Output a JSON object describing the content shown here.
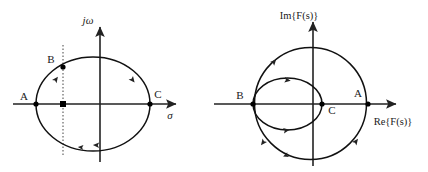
{
  "figure": {
    "panels": [
      {
        "id": "s-plane",
        "name": "s-plane contour",
        "axes": {
          "vertical_label": "jω",
          "horizontal_label": "σ"
        },
        "points": [
          {
            "label": "A",
            "x": 36,
            "y": 104
          },
          {
            "label": "B",
            "x": 63,
            "y": 67
          },
          {
            "label": "C",
            "x": 150,
            "y": 104
          }
        ],
        "markers": [
          {
            "name": "square-marker",
            "x": 63,
            "y": 104
          }
        ],
        "guides": [
          {
            "name": "vertical-dotted-line",
            "x": 63,
            "y1": 45,
            "y2": 155
          }
        ],
        "contour": {
          "type": "ellipse",
          "cx": 93,
          "cy": 104,
          "rx": 57,
          "ry": 47,
          "direction": "clockwise"
        },
        "direction_arrows": 4
      },
      {
        "id": "f-plane",
        "name": "F(s)-plane image",
        "axes": {
          "vertical_label": "Im{F(s)}",
          "horizontal_label": "Re{F(s)}"
        },
        "points": [
          {
            "label": "B",
            "x": 253,
            "y": 104
          },
          {
            "label": "C",
            "x": 322,
            "y": 104
          },
          {
            "label": "A",
            "x": 368,
            "y": 104
          }
        ],
        "curves": [
          {
            "name": "outer-circle",
            "type": "circle",
            "cx": 310.5,
            "cy": 103.5,
            "r": 56
          },
          {
            "name": "inner-ellipse",
            "type": "ellipse",
            "cx": 287.5,
            "cy": 104,
            "rx": 34.5,
            "ry": 26
          }
        ],
        "direction_arrows": 6
      }
    ],
    "colors": {
      "stroke": "#111111",
      "axis": "#222222",
      "guide": "#555555",
      "background": "#ffffff"
    }
  }
}
